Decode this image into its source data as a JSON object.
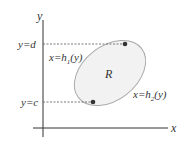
{
  "diagram": {
    "axes": {
      "x_label": "x",
      "y_label": "y"
    },
    "region_label": "R",
    "levels": {
      "top": "y=d",
      "bottom": "y=c"
    },
    "curves": {
      "left": {
        "prefix": "x=h",
        "sub": "1",
        "suffix": "(y)"
      },
      "right": {
        "prefix": "x=h",
        "sub": "2",
        "suffix": "(y)"
      }
    },
    "colors": {
      "axis": "#333333",
      "ellipse_stroke": "#aaaaaa",
      "ellipse_fill": "#f2f2f2",
      "dot": "#333333",
      "dashed": "#555555"
    }
  }
}
